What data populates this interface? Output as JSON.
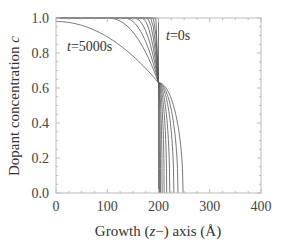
{
  "chart_data": {
    "type": "line",
    "title": "",
    "xlabel": "Growth (z−) axis (Å)",
    "xlabel_parts": {
      "pre": "Growth (",
      "italic": "z",
      "post": "−) axis (Å)"
    },
    "ylabel": "Dopant concentration c",
    "ylabel_parts": {
      "pre": "Dopant concentration ",
      "italic": "c"
    },
    "xlim": [
      0,
      400
    ],
    "ylim": [
      0.0,
      1.0
    ],
    "xticks": [
      0,
      100,
      200,
      300,
      400
    ],
    "xtick_labels": [
      "0",
      "100",
      "200",
      "300",
      "400"
    ],
    "yticks": [
      0.0,
      0.2,
      0.4,
      0.6,
      0.8,
      1.0
    ],
    "ytick_labels": [
      "0.0",
      "0.2",
      "0.4",
      "0.6",
      "0.8",
      "1.0"
    ],
    "grid": false,
    "legend": null,
    "annotations": [
      {
        "text_italic": "t",
        "text": "=0s",
        "x": 213,
        "y": 0.93
      },
      {
        "text_italic": "t",
        "text": "=5000s",
        "x": 22,
        "y": 0.82
      }
    ],
    "crossing_point": {
      "x": 200,
      "y": 0.63
    },
    "series_description": "Family of dopant profiles from t=0s (step at z=200 Å) to t=5000s; profiles broaden with time and all pass through ~(200, 0.63)",
    "series": [
      {
        "name": "t=0s",
        "left_width": 0,
        "right_end": 200
      },
      {
        "name": "t1",
        "left_width": 6,
        "right_end": 202
      },
      {
        "name": "t2",
        "left_width": 11,
        "right_end": 204
      },
      {
        "name": "t3",
        "left_width": 17,
        "right_end": 207
      },
      {
        "name": "t4",
        "left_width": 24,
        "right_end": 211
      },
      {
        "name": "t5",
        "left_width": 34,
        "right_end": 216
      },
      {
        "name": "t6",
        "left_width": 48,
        "right_end": 222
      },
      {
        "name": "t7",
        "left_width": 68,
        "right_end": 230
      },
      {
        "name": "t8",
        "left_width": 100,
        "right_end": 238
      },
      {
        "name": "t=5000s",
        "left_width": 200,
        "right_end": 248,
        "left_start_value": 0.98
      }
    ]
  }
}
